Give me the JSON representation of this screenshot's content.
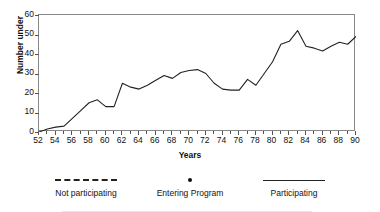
{
  "chart_data": {
    "type": "line",
    "title": "",
    "xlabel": "Years",
    "ylabel": "Number under",
    "xlim": [
      52,
      90
    ],
    "ylim": [
      0,
      60
    ],
    "ytick_labels": [
      "0",
      "10",
      "20",
      "30",
      "40",
      "50",
      "60"
    ],
    "ytick_values": [
      0,
      10,
      20,
      30,
      40,
      50,
      60
    ],
    "xtick_labels": [
      "52",
      "54",
      "56",
      "58",
      "60",
      "62",
      "64",
      "66",
      "68",
      "70",
      "72",
      "74",
      "76",
      "78",
      "80",
      "82",
      "84",
      "86",
      "88",
      "90"
    ],
    "xtick_values": [
      52,
      54,
      56,
      58,
      60,
      62,
      64,
      66,
      68,
      70,
      72,
      74,
      76,
      78,
      80,
      82,
      84,
      86,
      88,
      90
    ],
    "xtick_minor_step": 1,
    "grid": false,
    "legend_position": "below",
    "series": [
      {
        "name": "Participating",
        "style": "solid",
        "color": "#222222",
        "x": [
          52,
          53,
          54,
          55,
          56,
          57,
          58,
          59,
          60,
          61,
          62,
          63,
          64,
          65,
          66,
          67,
          68,
          69,
          70,
          71,
          72,
          73,
          74,
          75,
          76,
          77,
          78,
          79,
          80,
          81,
          82,
          83,
          84,
          85,
          86,
          87,
          88,
          89,
          90
        ],
        "values": [
          0,
          1.5,
          2.5,
          3,
          7,
          11,
          15,
          16.5,
          13,
          13,
          25,
          23,
          22,
          24,
          26.5,
          29,
          27.5,
          30.5,
          31.5,
          32,
          30,
          25,
          22,
          21.5,
          21.5,
          27,
          24,
          30,
          36,
          45,
          46.5,
          52,
          44,
          43,
          41.5,
          44,
          46,
          45,
          49
        ]
      }
    ],
    "legend": [
      {
        "label": "Not participating",
        "marker": "dashed-line"
      },
      {
        "label": "Entering Program",
        "marker": "filled-dot"
      },
      {
        "label": "Participating",
        "marker": "solid-line"
      }
    ]
  },
  "axis": {
    "y_title": "Number under",
    "x_title": "Years"
  },
  "colors": {
    "line": "#222222",
    "frame": "#888888",
    "text": "#111111"
  }
}
